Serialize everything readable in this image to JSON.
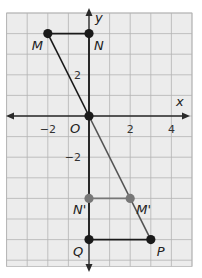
{
  "axes": {
    "x_label": "x",
    "y_label": "y",
    "origin_label": "O",
    "x_ticks": [
      {
        "value": -2,
        "label": "−2"
      },
      {
        "value": 2,
        "label": "2"
      },
      {
        "value": 4,
        "label": "4"
      }
    ],
    "y_ticks": [
      {
        "value": 2,
        "label": "2"
      },
      {
        "value": -2,
        "label": "−2"
      }
    ],
    "x_range": [
      -4,
      5
    ],
    "y_range": [
      -7.3,
      5
    ]
  },
  "points": [
    {
      "id": "M",
      "label": "M",
      "x": -2,
      "y": 4,
      "color": "#1a1a1a"
    },
    {
      "id": "N",
      "label": "N",
      "x": 0,
      "y": 4,
      "color": "#1a1a1a"
    },
    {
      "id": "O",
      "label": "",
      "x": 0,
      "y": 0,
      "color": "#1a1a1a"
    },
    {
      "id": "N'",
      "label": "N'",
      "x": 0,
      "y": -4,
      "color": "#777777"
    },
    {
      "id": "M'",
      "label": "M'",
      "x": 2,
      "y": -4,
      "color": "#777777"
    },
    {
      "id": "Q",
      "label": "Q",
      "x": 0,
      "y": -6,
      "color": "#1a1a1a"
    },
    {
      "id": "P",
      "label": "P",
      "x": 3,
      "y": -6,
      "color": "#1a1a1a"
    }
  ],
  "segments": [
    {
      "from": "M",
      "to": "N",
      "color": "#1a1a1a"
    },
    {
      "from": "M",
      "to": "O",
      "color": "#1a1a1a"
    },
    {
      "from": "N",
      "to": "O",
      "color": "#1a1a1a"
    },
    {
      "from": "O",
      "to": "P",
      "color": "#555555"
    },
    {
      "from": "N'",
      "to": "M'",
      "color": "#777777"
    },
    {
      "from": "Q",
      "to": "P",
      "color": "#1a1a1a"
    },
    {
      "from": "O",
      "to": "Q",
      "color": "#1a1a1a"
    }
  ],
  "colors": {
    "grid_bg": "#ececec",
    "grid_line": "#b4b4b4",
    "axis": "#2a2a2a"
  }
}
